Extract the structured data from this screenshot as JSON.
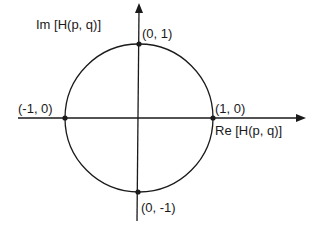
{
  "diagram": {
    "type": "unit-circle-complex-plane",
    "axes": {
      "x_label": "Re [H(p, q)]",
      "y_label": "Im [H(p, q)]"
    },
    "points": [
      {
        "id": "top",
        "label": "(0, 1)",
        "x": 0,
        "y": 1
      },
      {
        "id": "right",
        "label": "(1, 0)",
        "x": 1,
        "y": 0
      },
      {
        "id": "left",
        "label": "(-1, 0)",
        "x": -1,
        "y": 0
      },
      {
        "id": "bottom",
        "label": "(0, -1)",
        "x": 0,
        "y": -1
      }
    ],
    "colors": {
      "stroke": "#1a1a1a",
      "background": "#ffffff"
    }
  }
}
